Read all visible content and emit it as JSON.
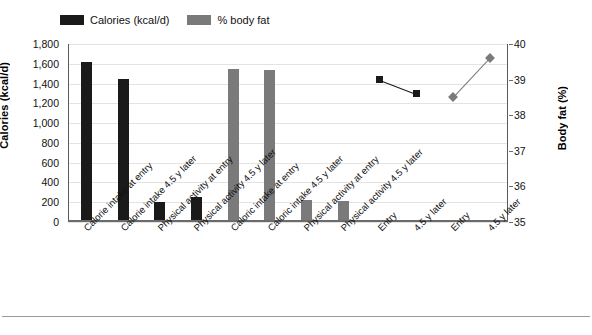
{
  "legend": {
    "items": [
      {
        "label": "Calories (kcal/d)",
        "color": "#1a1a1a",
        "key": "calories"
      },
      {
        "label": "% body fat",
        "color": "#7a7a7a",
        "key": "body-fat"
      }
    ]
  },
  "axes": {
    "left": {
      "title": "Calories (kcal/d)",
      "min": 0,
      "max": 1800,
      "step": 200,
      "ticks": [
        "0",
        "200",
        "400",
        "600",
        "800",
        "1,000",
        "1,200",
        "1,400",
        "1,600",
        "1,800"
      ]
    },
    "right": {
      "title": "Body fat (%)",
      "min": 35,
      "max": 40,
      "step": 1,
      "ticks": [
        "35",
        "36",
        "37",
        "38",
        "39",
        "40"
      ]
    }
  },
  "colors": {
    "black_series": "#1a1a1a",
    "gray_series": "#7a7a7a",
    "gridline": "#e3e3e3",
    "axis": "#6b6b6b",
    "background": "#ffffff"
  },
  "chart_data": {
    "type": "bar",
    "title": "",
    "subtitle": "",
    "xlabel": "",
    "ylabel": "Calories (kcal/d)",
    "y2label": "Body fat (%)",
    "ylim": [
      0,
      1800
    ],
    "y2lim": [
      35,
      40
    ],
    "grid": true,
    "legend_position": "top-center",
    "categories": [
      "Calorie intake at entry",
      "Calorie intake 4.5 y later",
      "Physical activity at entry",
      "Physical activity 4.5 y later",
      "Caloric intake at entry",
      "Caloric intake 4.5 y later",
      "Physical activity at entry",
      "Physical activity 4.5 y later",
      "Entry",
      "4.5 y later",
      "Entry",
      "4.5 y later"
    ],
    "series": [
      {
        "name": "Calories (kcal/d)",
        "type": "bar",
        "axis": "left",
        "color": "#1a1a1a",
        "values": [
          1620,
          1450,
          200,
          255,
          null,
          null,
          null,
          null,
          null,
          null,
          null,
          null
        ]
      },
      {
        "name": "% body fat",
        "type": "bar",
        "axis": "left",
        "color": "#7a7a7a",
        "values": [
          null,
          null,
          null,
          null,
          1550,
          1535,
          228,
          215,
          null,
          null,
          null,
          null
        ]
      },
      {
        "name": "Calories (kcal/d) body fat line",
        "type": "line",
        "axis": "right",
        "color": "#1a1a1a",
        "marker": "square",
        "values": [
          null,
          null,
          null,
          null,
          null,
          null,
          null,
          null,
          39.0,
          38.6,
          null,
          null
        ]
      },
      {
        "name": "% body fat line",
        "type": "line",
        "axis": "right",
        "color": "#7a7a7a",
        "marker": "diamond",
        "values": [
          null,
          null,
          null,
          null,
          null,
          null,
          null,
          null,
          null,
          null,
          38.5,
          39.6
        ]
      }
    ]
  },
  "footer": {
    "rule": true,
    "caption_sliver": ""
  }
}
